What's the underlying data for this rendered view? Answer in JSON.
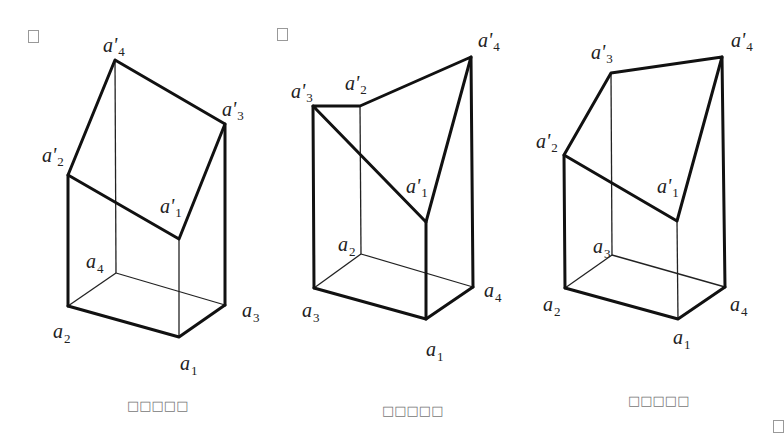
{
  "figures": [
    {
      "id": "left",
      "caption": "□□□□□",
      "vertices": {
        "a1": [
          179,
          337
        ],
        "a2": [
          68,
          306
        ],
        "a3": [
          225,
          305
        ],
        "a4": [
          116,
          273
        ],
        "a1p": [
          179,
          239
        ],
        "a2p": [
          68,
          175
        ],
        "a3p": [
          225,
          124
        ],
        "a4p": [
          115,
          60
        ]
      },
      "labels": [
        {
          "base": "a",
          "prime": true,
          "sub": "4",
          "x": 103,
          "y": 52
        },
        {
          "base": "a",
          "prime": true,
          "sub": "3",
          "x": 222,
          "y": 116
        },
        {
          "base": "a",
          "prime": true,
          "sub": "2",
          "x": 42,
          "y": 162
        },
        {
          "base": "a",
          "prime": true,
          "sub": "1",
          "x": 160,
          "y": 213
        },
        {
          "base": "a",
          "prime": false,
          "sub": "4",
          "x": 86,
          "y": 268
        },
        {
          "base": "a",
          "prime": false,
          "sub": "2",
          "x": 53,
          "y": 338
        },
        {
          "base": "a",
          "prime": false,
          "sub": "3",
          "x": 242,
          "y": 317
        },
        {
          "base": "a",
          "prime": false,
          "sub": "1",
          "x": 180,
          "y": 370
        }
      ]
    },
    {
      "id": "middle",
      "caption": "□□□□□",
      "vertices": {
        "a1": [
          426,
          319
        ],
        "a2": [
          361,
          254
        ],
        "a3": [
          314,
          288
        ],
        "a4": [
          473,
          287
        ],
        "a1p": [
          426,
          222
        ],
        "a2p": [
          360,
          106
        ],
        "a3p": [
          313,
          106
        ],
        "a4p": [
          471,
          57
        ]
      },
      "labels": [
        {
          "base": "a",
          "prime": true,
          "sub": "4",
          "x": 478,
          "y": 47
        },
        {
          "base": "a",
          "prime": true,
          "sub": "3",
          "x": 291,
          "y": 98
        },
        {
          "base": "a",
          "prime": true,
          "sub": "2",
          "x": 345,
          "y": 90
        },
        {
          "base": "a",
          "prime": true,
          "sub": "1",
          "x": 406,
          "y": 193
        },
        {
          "base": "a",
          "prime": false,
          "sub": "2",
          "x": 338,
          "y": 251
        },
        {
          "base": "a",
          "prime": false,
          "sub": "3",
          "x": 302,
          "y": 317
        },
        {
          "base": "a",
          "prime": false,
          "sub": "4",
          "x": 484,
          "y": 297
        },
        {
          "base": "a",
          "prime": false,
          "sub": "1",
          "x": 426,
          "y": 356
        }
      ]
    },
    {
      "id": "right",
      "caption": "□□□□□",
      "vertices": {
        "a1": [
          678,
          319
        ],
        "a2": [
          565,
          288
        ],
        "a3": [
          612,
          255
        ],
        "a4": [
          725,
          287
        ],
        "a1p": [
          677,
          221
        ],
        "a2p": [
          564,
          155
        ],
        "a3p": [
          611,
          73
        ],
        "a4p": [
          722,
          57
        ]
      },
      "labels": [
        {
          "base": "a",
          "prime": true,
          "sub": "4",
          "x": 731,
          "y": 47
        },
        {
          "base": "a",
          "prime": true,
          "sub": "3",
          "x": 591,
          "y": 59
        },
        {
          "base": "a",
          "prime": true,
          "sub": "2",
          "x": 536,
          "y": 148
        },
        {
          "base": "a",
          "prime": true,
          "sub": "1",
          "x": 657,
          "y": 193
        },
        {
          "base": "a",
          "prime": false,
          "sub": "3",
          "x": 593,
          "y": 253
        },
        {
          "base": "a",
          "prime": false,
          "sub": "2",
          "x": 543,
          "y": 311
        },
        {
          "base": "a",
          "prime": false,
          "sub": "4",
          "x": 730,
          "y": 311
        },
        {
          "base": "a",
          "prime": false,
          "sub": "1",
          "x": 673,
          "y": 344
        }
      ]
    }
  ],
  "markers": [
    {
      "x": 28,
      "y": 30
    },
    {
      "x": 277,
      "y": 28
    },
    {
      "x": 773,
      "y": 420
    }
  ]
}
